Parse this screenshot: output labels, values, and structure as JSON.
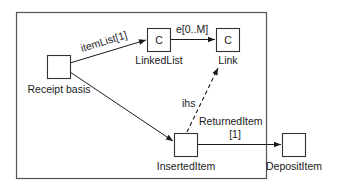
{
  "diagram": {
    "container": {
      "label": ""
    },
    "nodes": {
      "receipt_basis": {
        "label": "Receipt basis",
        "glyph": ""
      },
      "linked_list": {
        "label": "LinkedList",
        "glyph": "C"
      },
      "link": {
        "label": "Link",
        "glyph": "C"
      },
      "inserted_item": {
        "label": "InsertedItem",
        "glyph": ""
      },
      "deposit_item": {
        "label": "DepositItem",
        "glyph": ""
      }
    },
    "edges": {
      "item_list": {
        "label": "itemList[1]",
        "from": "Receipt basis",
        "to": "LinkedList",
        "style": "solid"
      },
      "e": {
        "label": "e[0..M]",
        "from": "LinkedList",
        "to": "Link",
        "style": "solid"
      },
      "receipt_to_inserted": {
        "label": "",
        "from": "Receipt basis",
        "to": "InsertedItem",
        "style": "solid"
      },
      "ihs": {
        "label": "ihs",
        "from": "InsertedItem",
        "to": "Link",
        "style": "dashed"
      },
      "returned_item": {
        "label": "ReturnedItem",
        "multiplicity": "[1]",
        "from": "InsertedItem",
        "to": "DepositItem",
        "style": "solid"
      }
    }
  }
}
